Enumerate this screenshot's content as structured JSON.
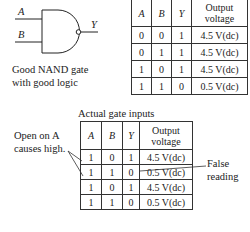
{
  "gate": {
    "input_a": "A",
    "input_b": "B",
    "output_y": "Y",
    "caption_line1": "Good NAND gate",
    "caption_line2": "with good logic"
  },
  "good_table": {
    "headers": [
      "A",
      "B",
      "Y",
      "Output voltage"
    ],
    "header_voltage_line1": "Output",
    "header_voltage_line2": "voltage",
    "rows": [
      [
        "0",
        "0",
        "1",
        "4.5 V(dc)"
      ],
      [
        "0",
        "1",
        "1",
        "4.5 V(dc)"
      ],
      [
        "1",
        "0",
        "1",
        "4.5 V(dc)"
      ],
      [
        "1",
        "1",
        "0",
        "0.5 V(dc)"
      ]
    ]
  },
  "actual_table": {
    "title": "Actual gate inputs",
    "headers": [
      "A",
      "B",
      "Y",
      "Output voltage"
    ],
    "header_voltage_line1": "Output",
    "header_voltage_line2": "voltage",
    "rows": [
      [
        "1",
        "0",
        "1",
        "4.5 V(dc)"
      ],
      [
        "1",
        "1",
        "0",
        "0.5 V(dc)"
      ],
      [
        "1",
        "0",
        "1",
        "4.5 V(dc)"
      ],
      [
        "1",
        "1",
        "0",
        "0.5 V(dc)"
      ]
    ]
  },
  "annotations": {
    "open_line1": "Open on A",
    "open_line2": "causes high.",
    "false_line1": "False",
    "false_line2": "reading"
  }
}
